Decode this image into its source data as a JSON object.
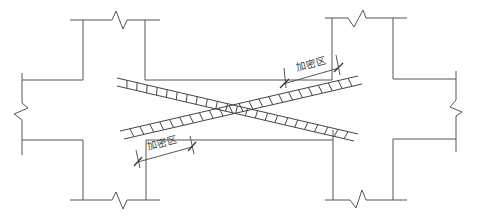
{
  "diagram": {
    "labels": {
      "densified_zone_upper": "加密区",
      "densified_zone_lower": "加密区"
    },
    "colors": {
      "line": "#555555",
      "bar": "#444444",
      "text": "#444444"
    }
  }
}
